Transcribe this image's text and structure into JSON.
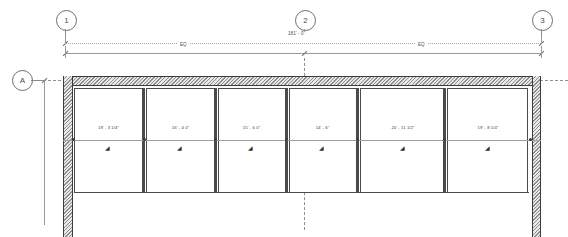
{
  "drawing": {
    "type": "architectural-floor-plan",
    "grid_bubbles_top": [
      {
        "label": "1",
        "x": 65
      },
      {
        "label": "2",
        "x": 304
      },
      {
        "label": "3",
        "x": 541
      }
    ],
    "grid_bubbles_left": [
      {
        "label": "A",
        "y": 80
      }
    ],
    "overall_dimension": "181' - 0\"",
    "equal_segments": [
      {
        "label": "EQ"
      },
      {
        "label": "EQ"
      }
    ],
    "bays": [
      {
        "dimension": "19' - 3 1/4\"",
        "symbol": "◢"
      },
      {
        "dimension": "16' - 4 0\"",
        "symbol": "◢"
      },
      {
        "dimension": "15' - 6 0\"",
        "symbol": "◢"
      },
      {
        "dimension": "14' - 6\"",
        "symbol": "◢"
      },
      {
        "dimension": "20' - 11 1/2\"",
        "symbol": "◢"
      },
      {
        "dimension": "19' - 8 1/4\"",
        "symbol": "◢"
      }
    ],
    "colors": {
      "line": "#4b4b4b",
      "thin_line": "#9a9a9a",
      "wall_fill": "#e8e8e8",
      "text": "#3f3f3f",
      "background": "#ffffff"
    }
  }
}
